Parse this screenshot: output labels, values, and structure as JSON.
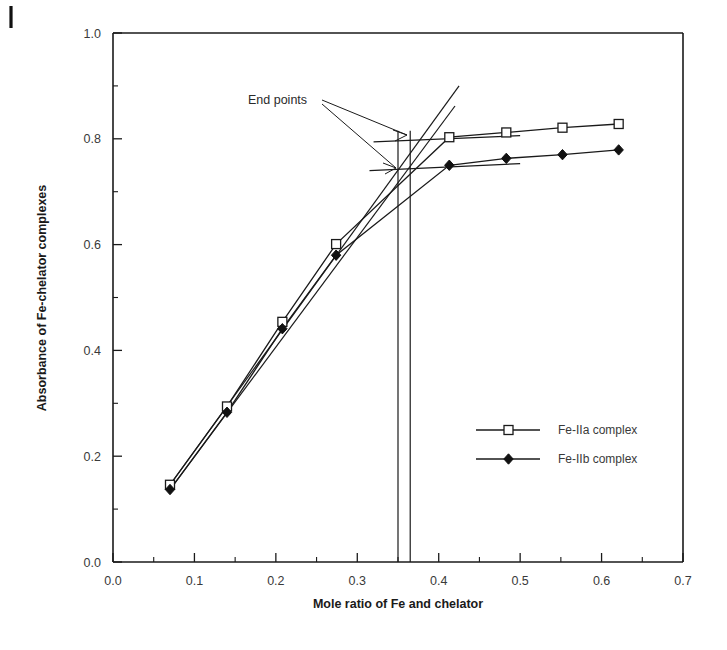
{
  "chart_data": {
    "type": "line",
    "title": "",
    "xlabel": "Mole ratio of Fe and chelator",
    "ylabel": "Absorbance of Fe-chelator complexes",
    "xlim": [
      0.0,
      0.7
    ],
    "ylim": [
      0.0,
      1.0
    ],
    "xticks": [
      "0.0",
      "0.1",
      "0.2",
      "0.3",
      "0.4",
      "0.5",
      "0.6",
      "0.7"
    ],
    "xtick_values": [
      0.0,
      0.1,
      0.2,
      0.3,
      0.4,
      0.5,
      0.6,
      0.7
    ],
    "yticks": [
      "0.0",
      "0.2",
      "0.4",
      "0.6",
      "0.8",
      "1.0"
    ],
    "ytick_values": [
      0.0,
      0.2,
      0.4,
      0.6,
      0.8,
      1.0
    ],
    "minor_x_values": [
      0.05,
      0.15,
      0.25,
      0.35,
      0.45,
      0.55,
      0.65
    ],
    "minor_y_values": [
      0.1,
      0.3,
      0.5,
      0.7,
      0.9
    ],
    "grid": false,
    "legend_position": "center-right",
    "series": [
      {
        "name": "Fe-IIa complex",
        "marker": "open-square",
        "x": [
          0.07,
          0.14,
          0.208,
          0.274,
          0.413,
          0.483,
          0.552,
          0.621
        ],
        "values": [
          0.146,
          0.294,
          0.454,
          0.601,
          0.803,
          0.812,
          0.821,
          0.828
        ]
      },
      {
        "name": "Fe-IIb complex",
        "marker": "filled-diamond",
        "x": [
          0.07,
          0.14,
          0.208,
          0.274,
          0.413,
          0.483,
          0.552,
          0.621
        ],
        "values": [
          0.137,
          0.283,
          0.441,
          0.58,
          0.75,
          0.763,
          0.77,
          0.779
        ]
      }
    ],
    "extrapolation_lines": [
      {
        "name": "rising-a-extension",
        "x": [
          0.07,
          0.425
        ],
        "y": [
          0.146,
          0.9
        ]
      },
      {
        "name": "rising-b-extension",
        "x": [
          0.07,
          0.42
        ],
        "y": [
          0.137,
          0.862
        ]
      },
      {
        "name": "plateau-a-extension",
        "x": [
          0.32,
          0.5
        ],
        "y": [
          0.794,
          0.806
        ]
      },
      {
        "name": "plateau-b-extension",
        "x": [
          0.315,
          0.5
        ],
        "y": [
          0.74,
          0.753
        ]
      }
    ],
    "endpoint_markers": {
      "label": "End points",
      "vertical_lines_x": [
        0.35,
        0.365
      ],
      "intersections": [
        {
          "x": 0.365,
          "y": 0.8,
          "series": "Fe-IIa complex"
        },
        {
          "x": 0.35,
          "y": 0.745,
          "series": "Fe-IIb complex"
        }
      ]
    },
    "colors": {
      "axis": "#1a1a1a",
      "series_a": "#1a1a1a",
      "series_b": "#111111",
      "background": "#ffffff"
    }
  }
}
